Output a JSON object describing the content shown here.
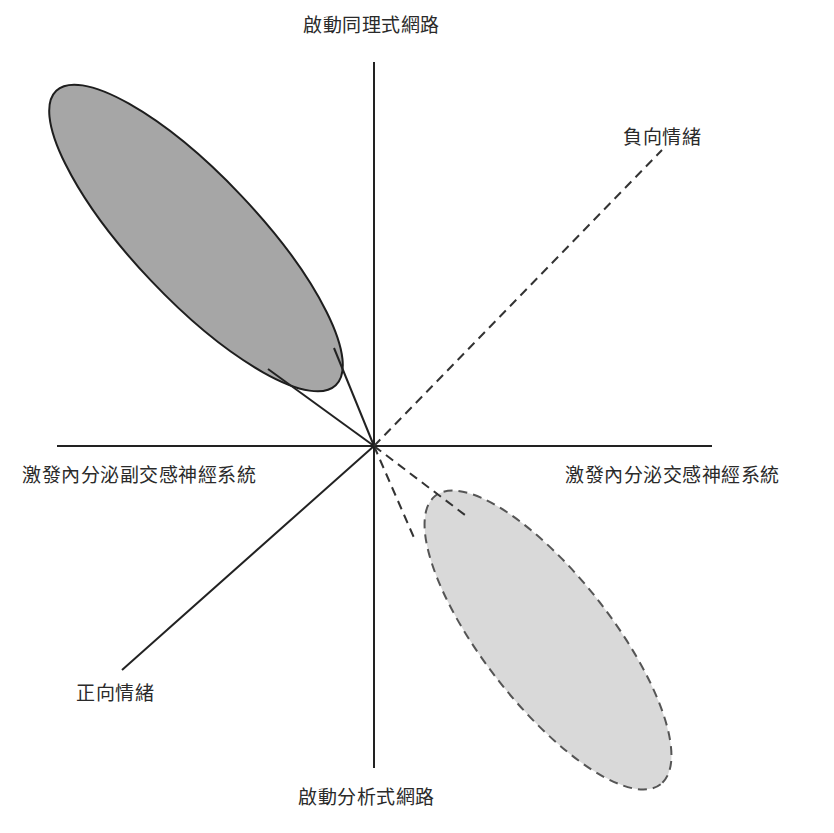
{
  "diagram": {
    "type": "quadrant-diagram",
    "axes": {
      "top": "啟動同理式網路",
      "bottom": "啟動分析式網路",
      "left": "激發內分泌副交感神經系統",
      "right": "激發內分泌交感神經系統"
    },
    "diagonals": {
      "positive": "正向情緒",
      "negative": "負向情緒"
    },
    "regions": [
      {
        "name": "positive-emotion-region",
        "fill": "#a6a6a6",
        "stroke": "solid",
        "quadrant": "upper-left"
      },
      {
        "name": "negative-emotion-region",
        "fill": "#d9d9d9",
        "stroke": "dashed",
        "quadrant": "lower-right"
      }
    ],
    "colors": {
      "line": "#222222",
      "dark_fill": "#a6a6a6",
      "light_fill": "#d9d9d9"
    }
  }
}
